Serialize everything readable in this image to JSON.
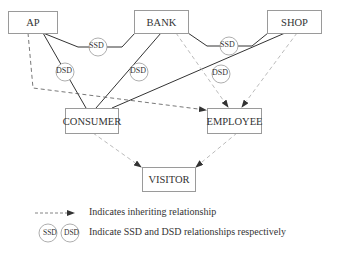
{
  "diagram": {
    "nodes": {
      "ap": {
        "label": "AP"
      },
      "bank": {
        "label": "BANK"
      },
      "shop": {
        "label": "SHOP"
      },
      "consumer": {
        "label": "CONSUMER"
      },
      "employee": {
        "label": "EMPLOYEE"
      },
      "visitor": {
        "label": "VISITOR"
      }
    },
    "constraints": {
      "ssd_ap_bank": "SSD",
      "ssd_bank_shop": "SSD",
      "dsd_ap_consumer": "DSD",
      "dsd_bank_consumer": "DSD",
      "dsd_shop_consumer": "DSD"
    },
    "edges": [
      {
        "from": "AP",
        "to": "CONSUMER",
        "type": "solid",
        "via": "DSD"
      },
      {
        "from": "BANK",
        "to": "CONSUMER",
        "type": "solid",
        "via": "DSD"
      },
      {
        "from": "SHOP",
        "to": "CONSUMER",
        "type": "solid",
        "via": "DSD"
      },
      {
        "from": "AP",
        "to": "BANK",
        "type": "solid",
        "via": "SSD"
      },
      {
        "from": "BANK",
        "to": "SHOP",
        "type": "solid",
        "via": "SSD"
      },
      {
        "from": "AP",
        "to": "EMPLOYEE",
        "type": "inherit"
      },
      {
        "from": "BANK",
        "to": "EMPLOYEE",
        "type": "inherit"
      },
      {
        "from": "SHOP",
        "to": "EMPLOYEE",
        "type": "inherit"
      },
      {
        "from": "CONSUMER",
        "to": "VISITOR",
        "type": "inherit"
      },
      {
        "from": "EMPLOYEE",
        "to": "VISITOR",
        "type": "inherit"
      }
    ]
  },
  "legend": {
    "inherit_text": "Indicates inheriting relationship",
    "ssd_label": "SSD",
    "dsd_label": "DSD",
    "constraint_text": "Indicate SSD and DSD relationships respectively"
  }
}
